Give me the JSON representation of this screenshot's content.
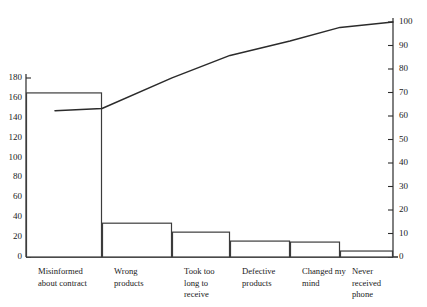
{
  "chart_data": {
    "type": "bar",
    "title": "",
    "subtitle": "",
    "xlabel": "",
    "ylabel": "",
    "categories": [
      "Misinformed\nabout contract",
      "Wrong\nproducts",
      "Took too\nlong to\nreceive",
      "Defective\nproducts",
      "Changed my\nmind",
      "Never\nreceived\nphone"
    ],
    "values": [
      165,
      34,
      25,
      16,
      15,
      6
    ],
    "series": [
      {
        "name": "Frequency",
        "values": [
          165,
          34,
          25,
          16,
          15,
          6
        ]
      },
      {
        "name": "Cumulative percentage",
        "values": [
          63.2,
          76.2,
          85.8,
          91.9,
          97.7,
          100.0
        ]
      }
    ],
    "left_axis": {
      "label": "",
      "ticks": [
        0,
        20,
        40,
        60,
        80,
        100,
        120,
        140,
        160,
        180
      ],
      "ylim": [
        0,
        180
      ]
    },
    "right_axis": {
      "label": "",
      "ticks": [
        0,
        10,
        20,
        30,
        40,
        50,
        60,
        70,
        80,
        90,
        100
      ],
      "ylim": [
        0,
        100
      ]
    },
    "grid": false,
    "legend": "none",
    "colors": {
      "bar_stroke": "#3c3c3c",
      "bar_fill": "#ffffff",
      "line": "#2b2b2b",
      "axis": "#2b2b2b",
      "text": "#1a1a1a",
      "background": "#ffffff"
    }
  }
}
